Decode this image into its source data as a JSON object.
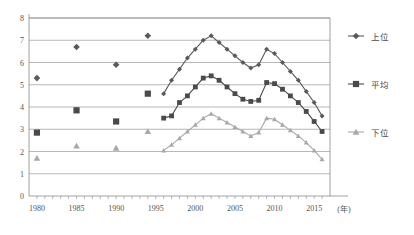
{
  "chart_data": {
    "type": "line",
    "title": "",
    "xlabel": "(年)",
    "ylabel": "",
    "xlim": [
      1979,
      2017
    ],
    "ylim": [
      0,
      8
    ],
    "grid": true,
    "legend_position": "right",
    "x_tick_labels": [
      "1980",
      "1985",
      "1990",
      "1995",
      "2000",
      "2005",
      "2010",
      "2015"
    ],
    "x_tick_values": [
      1980,
      1985,
      1990,
      1995,
      2000,
      2005,
      2010,
      2015
    ],
    "y_tick_labels": [
      "0",
      "1",
      "2",
      "3",
      "4",
      "5",
      "6",
      "7",
      "8"
    ],
    "y_tick_values": [
      0,
      1,
      2,
      3,
      4,
      5,
      6,
      7,
      8
    ],
    "series": [
      {
        "name": "上位",
        "marker": "diamond",
        "color": "#5a5a5a",
        "sparse_points": [
          {
            "x": 1980,
            "y": 5.3
          },
          {
            "x": 1985,
            "y": 6.7
          },
          {
            "x": 1990,
            "y": 5.9
          },
          {
            "x": 1994,
            "y": 7.2
          }
        ],
        "x": [
          1996,
          1997,
          1998,
          1999,
          2000,
          2001,
          2002,
          2003,
          2004,
          2005,
          2006,
          2007,
          2008,
          2009,
          2010,
          2011,
          2012,
          2013,
          2014,
          2015,
          2016
        ],
        "values": [
          4.6,
          5.2,
          5.7,
          6.2,
          6.6,
          7.0,
          7.2,
          6.9,
          6.6,
          6.3,
          6.0,
          5.75,
          5.9,
          6.6,
          6.4,
          6.0,
          5.6,
          5.2,
          4.7,
          4.2,
          3.6
        ]
      },
      {
        "name": "平均",
        "marker": "square",
        "color": "#4a4a4a",
        "sparse_points": [
          {
            "x": 1980,
            "y": 2.85
          },
          {
            "x": 1985,
            "y": 3.85
          },
          {
            "x": 1990,
            "y": 3.35
          },
          {
            "x": 1994,
            "y": 4.6
          }
        ],
        "x": [
          1996,
          1997,
          1998,
          1999,
          2000,
          2001,
          2002,
          2003,
          2004,
          2005,
          2006,
          2007,
          2008,
          2009,
          2010,
          2011,
          2012,
          2013,
          2014,
          2015,
          2016
        ],
        "values": [
          3.5,
          3.6,
          4.2,
          4.5,
          4.9,
          5.3,
          5.4,
          5.2,
          4.9,
          4.6,
          4.35,
          4.25,
          4.3,
          5.1,
          5.05,
          4.8,
          4.5,
          4.2,
          3.8,
          3.35,
          2.9
        ]
      },
      {
        "name": "下位",
        "marker": "triangle",
        "color": "#a8a8a8",
        "sparse_points": [
          {
            "x": 1980,
            "y": 1.7
          },
          {
            "x": 1985,
            "y": 2.25
          },
          {
            "x": 1990,
            "y": 2.15
          },
          {
            "x": 1994,
            "y": 2.9
          }
        ],
        "x": [
          1996,
          1997,
          1998,
          1999,
          2000,
          2001,
          2002,
          2003,
          2004,
          2005,
          2006,
          2007,
          2008,
          2009,
          2010,
          2011,
          2012,
          2013,
          2014,
          2015,
          2016
        ],
        "values": [
          2.05,
          2.3,
          2.6,
          2.9,
          3.2,
          3.5,
          3.7,
          3.5,
          3.3,
          3.1,
          2.9,
          2.7,
          2.85,
          3.5,
          3.45,
          3.2,
          2.95,
          2.7,
          2.4,
          2.05,
          1.65
        ]
      }
    ]
  }
}
